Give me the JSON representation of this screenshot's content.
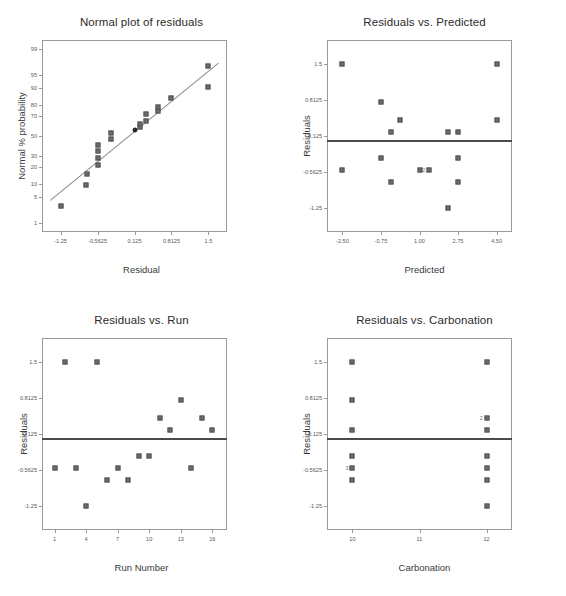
{
  "chart_data": [
    {
      "type": "scatter",
      "id": "normal-plot",
      "title": "Normal plot of residuals",
      "xlabel": "Residual",
      "ylabel": "Normal % probability",
      "xlim": [
        -1.595,
        1.845
      ],
      "ylim_prob": [
        0.5,
        99.5
      ],
      "xticks": [
        "-1.25",
        "-0.5625",
        "0.125",
        "0.8125",
        "1.5"
      ],
      "xtick_values": [
        -1.25,
        -0.5625,
        0.125,
        0.8125,
        1.5
      ],
      "yticks": [
        "99",
        "95",
        "90",
        "80",
        "70",
        "50",
        "30",
        "20",
        "10",
        "5",
        "1"
      ],
      "ytick_values": [
        99,
        95,
        90,
        80,
        70,
        50,
        30,
        20,
        10,
        5,
        1
      ],
      "grid": false,
      "reference_line": true,
      "points": [
        {
          "x": -1.25,
          "p": 3.1,
          "highlight": false
        },
        {
          "x": -0.78,
          "p": 9.4,
          "highlight": false
        },
        {
          "x": -0.75,
          "p": 15.6,
          "highlight": false
        },
        {
          "x": -0.5625,
          "p": 21.9,
          "highlight": false
        },
        {
          "x": -0.5625,
          "p": 28.1,
          "highlight": false
        },
        {
          "x": -0.5625,
          "p": 34.4,
          "highlight": false
        },
        {
          "x": -0.5625,
          "p": 40.6,
          "highlight": false
        },
        {
          "x": -0.31,
          "p": 46.9,
          "highlight": false
        },
        {
          "x": -0.31,
          "p": 53.1,
          "highlight": false
        },
        {
          "x": 0.125,
          "p": 56.0,
          "highlight": true
        },
        {
          "x": 0.22,
          "p": 59.4,
          "highlight": false
        },
        {
          "x": 0.22,
          "p": 62.5,
          "highlight": false
        },
        {
          "x": 0.34,
          "p": 65.6,
          "highlight": false
        },
        {
          "x": 0.34,
          "p": 71.9,
          "highlight": false
        },
        {
          "x": 0.56,
          "p": 75.0,
          "highlight": false
        },
        {
          "x": 0.56,
          "p": 78.1,
          "highlight": false
        },
        {
          "x": 0.81,
          "p": 84.4,
          "highlight": false
        },
        {
          "x": 1.5,
          "p": 90.6,
          "highlight": false
        },
        {
          "x": 1.5,
          "p": 96.9,
          "highlight": false
        }
      ]
    },
    {
      "type": "scatter",
      "id": "residuals-vs-predicted",
      "title": "Residuals vs. Predicted",
      "xlabel": "Predicted",
      "ylabel": "Residuals",
      "xlim": [
        -3.2,
        5.2
      ],
      "ylim": [
        -1.72,
        1.97
      ],
      "xticks": [
        "-2.50",
        "-0.75",
        "1.00",
        "2.75",
        "4.50"
      ],
      "xtick_values": [
        -2.5,
        -0.75,
        1.0,
        2.75,
        4.5
      ],
      "yticks": [
        "1.5",
        "0.8125",
        "0.125",
        "-0.5625",
        "-1.25"
      ],
      "ytick_values": [
        1.5,
        0.8125,
        0.125,
        -0.5625,
        -1.25
      ],
      "grid": false,
      "reference_line_y": 0.04,
      "points": [
        {
          "x": -2.5,
          "y": 1.5,
          "n": 1
        },
        {
          "x": -2.5,
          "y": -0.53,
          "n": 1
        },
        {
          "x": -0.75,
          "y": 0.77,
          "n": 1
        },
        {
          "x": -0.75,
          "y": -0.29,
          "n": 1
        },
        {
          "x": -0.31,
          "y": 0.2,
          "n": 1
        },
        {
          "x": -0.31,
          "y": -0.75,
          "n": 1
        },
        {
          "x": 0.12,
          "y": 0.44,
          "n": 1
        },
        {
          "x": 1.0,
          "y": -0.53,
          "n": 1
        },
        {
          "x": 1.45,
          "y": -0.53,
          "n": 2
        },
        {
          "x": 2.3,
          "y": 0.2,
          "n": 1
        },
        {
          "x": 2.3,
          "y": -1.25,
          "n": 1
        },
        {
          "x": 2.75,
          "y": 0.2,
          "n": 1
        },
        {
          "x": 2.75,
          "y": -0.29,
          "n": 1
        },
        {
          "x": 2.75,
          "y": -0.75,
          "n": 1
        },
        {
          "x": 4.5,
          "y": 1.5,
          "n": 1
        },
        {
          "x": 4.5,
          "y": 0.44,
          "n": 1
        }
      ]
    },
    {
      "type": "scatter",
      "id": "residuals-vs-run",
      "title": "Residuals vs. Run",
      "xlabel": "Run Number",
      "ylabel": "Residuals",
      "xlim": [
        -0.2,
        17.4
      ],
      "ylim": [
        -1.72,
        1.97
      ],
      "xticks": [
        "1",
        "4",
        "7",
        "10",
        "13",
        "16"
      ],
      "xtick_values": [
        1,
        4,
        7,
        10,
        13,
        16
      ],
      "yticks": [
        "1.5",
        "0.8125",
        "0.125",
        "-0.5625",
        "-1.25"
      ],
      "ytick_values": [
        1.5,
        0.8125,
        0.125,
        -0.5625,
        -1.25
      ],
      "grid": false,
      "reference_line_y": 0.04,
      "points": [
        {
          "x": 1,
          "y": -0.53,
          "n": 1
        },
        {
          "x": 2,
          "y": 1.5,
          "n": 1
        },
        {
          "x": 3,
          "y": -0.53,
          "n": 1
        },
        {
          "x": 4,
          "y": -1.25,
          "n": 1
        },
        {
          "x": 5,
          "y": 1.5,
          "n": 1
        },
        {
          "x": 6,
          "y": -0.75,
          "n": 1
        },
        {
          "x": 7,
          "y": -0.53,
          "n": 1
        },
        {
          "x": 8,
          "y": -0.75,
          "n": 1
        },
        {
          "x": 9,
          "y": -0.29,
          "n": 1
        },
        {
          "x": 10,
          "y": -0.29,
          "n": 1
        },
        {
          "x": 11,
          "y": 0.44,
          "n": 1
        },
        {
          "x": 12,
          "y": 0.2,
          "n": 1
        },
        {
          "x": 13,
          "y": 0.77,
          "n": 1
        },
        {
          "x": 14,
          "y": -0.53,
          "n": 1
        },
        {
          "x": 15,
          "y": 0.44,
          "n": 1
        },
        {
          "x": 16,
          "y": 0.2,
          "n": 1
        }
      ]
    },
    {
      "type": "scatter",
      "id": "residuals-vs-carbonation",
      "title": "Residuals vs. Carbonation",
      "xlabel": "Carbonation",
      "ylabel": "Residuals",
      "xlim": [
        9.62,
        12.38
      ],
      "ylim": [
        -1.72,
        1.97
      ],
      "xticks": [
        "10",
        "11",
        "12"
      ],
      "xtick_values": [
        10,
        11,
        12
      ],
      "yticks": [
        "1.5",
        "0.8125",
        "0.125",
        "-0.5625",
        "-1.25"
      ],
      "ytick_values": [
        1.5,
        0.8125,
        0.125,
        -0.5625,
        -1.25
      ],
      "grid": false,
      "reference_line_y": 0.04,
      "points": [
        {
          "x": 10,
          "y": 1.5,
          "n": 1
        },
        {
          "x": 10,
          "y": 0.77,
          "n": 1
        },
        {
          "x": 10,
          "y": 0.2,
          "n": 1
        },
        {
          "x": 10,
          "y": -0.29,
          "n": 1
        },
        {
          "x": 10,
          "y": -0.53,
          "n": 3
        },
        {
          "x": 10,
          "y": -0.75,
          "n": 1
        },
        {
          "x": 12,
          "y": 1.5,
          "n": 1
        },
        {
          "x": 12,
          "y": 0.44,
          "n": 2
        },
        {
          "x": 12,
          "y": 0.2,
          "n": 1
        },
        {
          "x": 12,
          "y": -0.29,
          "n": 1
        },
        {
          "x": 12,
          "y": -0.53,
          "n": 1
        },
        {
          "x": 12,
          "y": -0.75,
          "n": 1
        },
        {
          "x": 12,
          "y": -1.25,
          "n": 1
        }
      ]
    }
  ],
  "colors": {
    "marker": "#6b6b6b",
    "marker_highlight": "#2a2a2a",
    "axis": "#9a9a9a",
    "reference_line": "#4a4a4a",
    "text": "#3a3a3a",
    "background": "#ffffff"
  }
}
